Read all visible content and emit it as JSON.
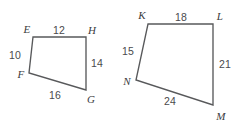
{
  "diagram": {
    "background_color": "#ffffff",
    "stroke_color": "#58595b",
    "label_color": "#3b3b3d",
    "measure_color": "#4a4a4c",
    "figures": [
      {
        "id": "quadrilateral-efgh",
        "name": "Quadrilateral EFGH",
        "vertices": [
          {
            "id": "E",
            "label": "E",
            "x": 33,
            "y": 37,
            "label_x": 27,
            "label_y": 29
          },
          {
            "id": "H",
            "label": "H",
            "x": 86,
            "y": 37,
            "label_x": 92,
            "label_y": 30
          },
          {
            "id": "G",
            "label": "G",
            "x": 86,
            "y": 90,
            "label_x": 91,
            "label_y": 99
          },
          {
            "id": "F",
            "label": "F",
            "x": 29,
            "y": 73,
            "label_x": 21,
            "label_y": 74
          }
        ],
        "path": "M 33 37 L 86 37 L 86 90 L 29 73 Z",
        "sides": [
          {
            "id": "EH",
            "from": "E",
            "to": "H",
            "length": "12",
            "label_x": 59,
            "label_y": 30
          },
          {
            "id": "HG",
            "from": "H",
            "to": "G",
            "length": "14",
            "label_x": 97,
            "label_y": 63
          },
          {
            "id": "GF",
            "from": "G",
            "to": "F",
            "length": "16",
            "label_x": 55,
            "label_y": 95
          },
          {
            "id": "FE",
            "from": "F",
            "to": "E",
            "length": "10",
            "label_x": 15,
            "label_y": 55
          }
        ]
      },
      {
        "id": "quadrilateral-klmn",
        "name": "Quadrilateral KLMN",
        "vertices": [
          {
            "id": "K",
            "label": "K",
            "x": 148,
            "y": 24,
            "label_x": 142,
            "label_y": 15
          },
          {
            "id": "L",
            "label": "L",
            "x": 213,
            "y": 24,
            "label_x": 220,
            "label_y": 16
          },
          {
            "id": "M",
            "label": "M",
            "x": 213,
            "y": 105,
            "label_x": 221,
            "label_y": 116
          },
          {
            "id": "N",
            "label": "N",
            "x": 136,
            "y": 80,
            "label_x": 127,
            "label_y": 81
          }
        ],
        "path": "M 148 24 L 213 24 L 213 105 L 136 80 Z",
        "sides": [
          {
            "id": "KL",
            "from": "K",
            "to": "L",
            "length": "18",
            "label_x": 181,
            "label_y": 17
          },
          {
            "id": "LM",
            "from": "L",
            "to": "M",
            "length": "21",
            "label_x": 225,
            "label_y": 64
          },
          {
            "id": "MN",
            "from": "M",
            "to": "N",
            "length": "24",
            "label_x": 170,
            "label_y": 101
          },
          {
            "id": "NK",
            "from": "N",
            "to": "K",
            "length": "15",
            "label_x": 128,
            "label_y": 51
          }
        ]
      }
    ]
  }
}
